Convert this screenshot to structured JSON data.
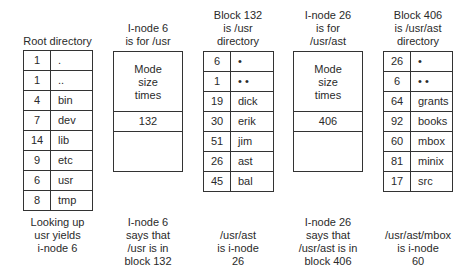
{
  "root_directory": {
    "title": "Root directory",
    "entries": [
      {
        "inode": "1",
        "name": "."
      },
      {
        "inode": "1",
        "name": ".."
      },
      {
        "inode": "4",
        "name": "bin"
      },
      {
        "inode": "7",
        "name": "dev"
      },
      {
        "inode": "14",
        "name": "lib"
      },
      {
        "inode": "9",
        "name": "etc"
      },
      {
        "inode": "6",
        "name": "usr"
      },
      {
        "inode": "8",
        "name": "tmp"
      }
    ],
    "caption": "Looking up\nusr yields\ni-node 6"
  },
  "inode_6": {
    "title": "I-node 6\nis for /usr",
    "attributes": "Mode\nsize\ntimes",
    "block": "132",
    "caption": "I-node 6\nsays that\n/usr is in\nblock 132"
  },
  "block_132": {
    "title": "Block 132\nis /usr\ndirectory",
    "entries": [
      {
        "inode": "6",
        "name": "•"
      },
      {
        "inode": "1",
        "name": "• •"
      },
      {
        "inode": "19",
        "name": "dick"
      },
      {
        "inode": "30",
        "name": "erik"
      },
      {
        "inode": "51",
        "name": "jim"
      },
      {
        "inode": "26",
        "name": "ast"
      },
      {
        "inode": "45",
        "name": "bal"
      }
    ],
    "caption": "/usr/ast\nis i-node\n26"
  },
  "inode_26": {
    "title": "I-node 26\nis for\n/usr/ast",
    "attributes": "Mode\nsize\ntimes",
    "block": "406",
    "caption": "I-node 26\nsays that\n/usr/ast is in\nblock 406"
  },
  "block_406": {
    "title": "Block 406\nis /usr/ast\ndirectory",
    "entries": [
      {
        "inode": "26",
        "name": "•"
      },
      {
        "inode": "6",
        "name": "• •"
      },
      {
        "inode": "64",
        "name": "grants"
      },
      {
        "inode": "92",
        "name": "books"
      },
      {
        "inode": "60",
        "name": "mbox"
      },
      {
        "inode": "81",
        "name": "minix"
      },
      {
        "inode": "17",
        "name": "src"
      }
    ],
    "caption": "/usr/ast/mbox\nis i-node\n60"
  }
}
